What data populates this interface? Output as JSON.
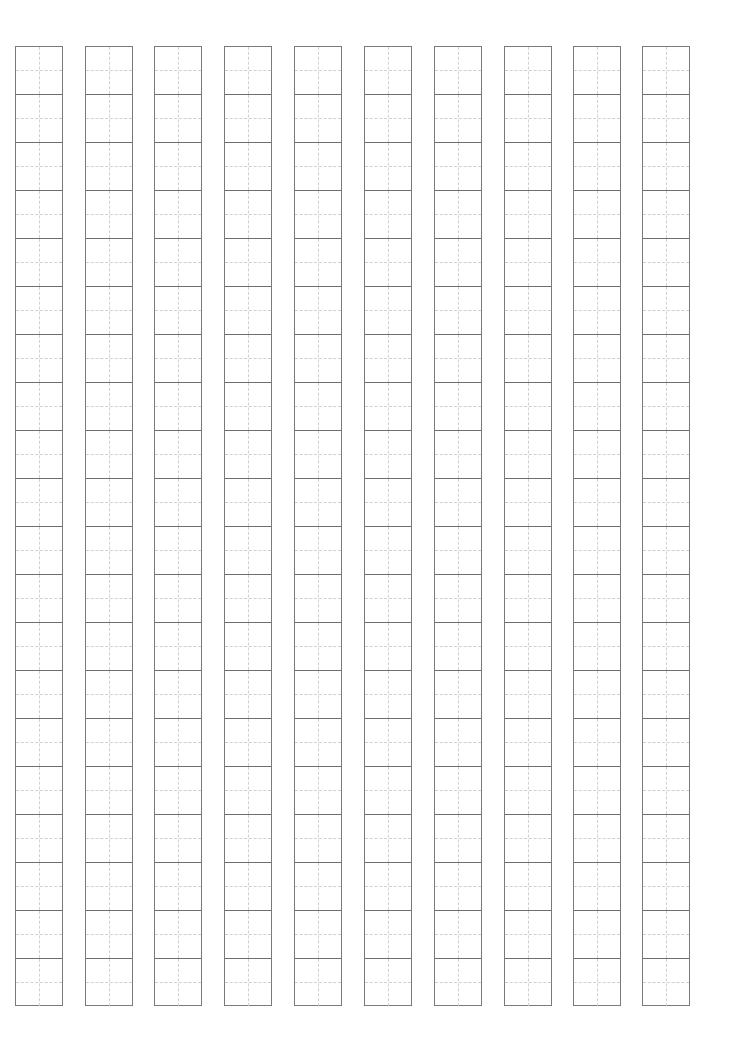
{
  "page": {
    "type": "writing-grid-paper",
    "columns": 10,
    "rows_per_column": 20,
    "column_x": [
      15,
      85,
      154,
      224,
      294,
      364,
      434,
      504,
      573,
      642
    ],
    "colors": {
      "border": "#7a7a7a",
      "cell_divider": "#6e6e6e",
      "guide_line": "#d0d0d0",
      "background": "#ffffff"
    }
  }
}
